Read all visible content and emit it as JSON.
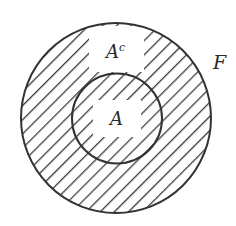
{
  "diagram": {
    "type": "set-complement-diagram",
    "outer_set": {
      "label": "F"
    },
    "inner_set": {
      "label": "A"
    },
    "complement_region": {
      "label_base": "A",
      "label_sup": "c"
    },
    "colors": {
      "background": "#ffffff",
      "stroke": "#333333",
      "hatch": "#3a3a3a",
      "text": "#2a2a2a"
    },
    "hatch_pattern": "diagonal-down-right"
  }
}
